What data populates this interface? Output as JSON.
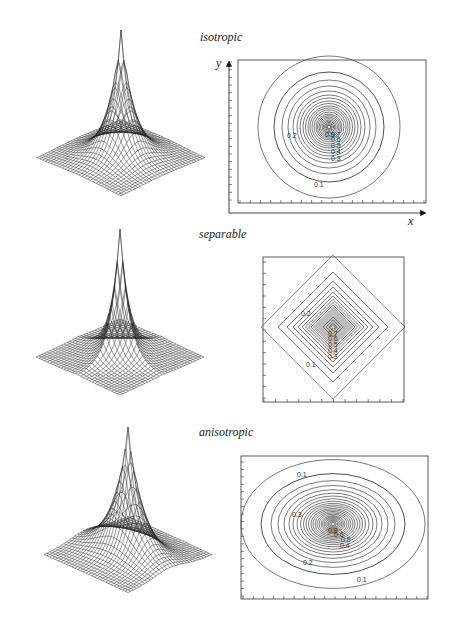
{
  "figure": {
    "panels": [
      {
        "id": "isotropic",
        "title": "isotropic",
        "surface": {
          "type": "wireframe",
          "shape": "radial peak"
        },
        "contour": {
          "shape": "circle",
          "axis_labels": {
            "x": "x",
            "y": "y"
          },
          "labels": [
            "0.2",
            "0.1",
            "0.3",
            "0.4",
            "0.5",
            "0.6",
            "0.7",
            "0.8",
            "0.9"
          ]
        }
      },
      {
        "id": "separable",
        "title": "separable",
        "surface": {
          "type": "wireframe",
          "shape": "cross-shaped peak"
        },
        "contour": {
          "shape": "diamond",
          "labels": [
            "0.2",
            "0.1",
            "0.3",
            "0.4",
            "0.5",
            "0.6",
            "0.7",
            "0.8",
            "0.9"
          ]
        }
      },
      {
        "id": "anisotropic",
        "title": "anisotropic",
        "surface": {
          "type": "wireframe",
          "shape": "elongated peak"
        },
        "contour": {
          "shape": "ellipse",
          "labels": [
            "0.1",
            "0.3",
            "0.2",
            "0.1",
            "0.4",
            "0.5",
            "0.6",
            "0.8"
          ]
        }
      }
    ]
  },
  "chart_data": [
    {
      "type": "heatmap",
      "title": "isotropic",
      "xlabel": "x",
      "ylabel": "y",
      "contour_levels": [
        0.1,
        0.2,
        0.3,
        0.4,
        0.5,
        0.6,
        0.7,
        0.8,
        0.9
      ],
      "contour_shape": "concentric circles",
      "grid": false
    },
    {
      "type": "heatmap",
      "title": "separable",
      "xlabel": "",
      "ylabel": "",
      "contour_levels": [
        0.1,
        0.2,
        0.3,
        0.4,
        0.5,
        0.6,
        0.7,
        0.8,
        0.9
      ],
      "contour_shape": "concentric diamonds",
      "grid": false
    },
    {
      "type": "heatmap",
      "title": "anisotropic",
      "xlabel": "",
      "ylabel": "",
      "contour_levels": [
        0.1,
        0.2,
        0.3,
        0.4,
        0.5,
        0.6,
        0.8
      ],
      "contour_shape": "concentric ellipses",
      "grid": false
    }
  ]
}
